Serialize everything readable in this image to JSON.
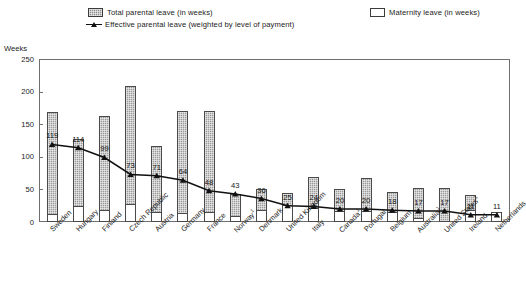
{
  "legend": {
    "items": [
      {
        "id": "total-parental-leave",
        "label": "Total parental leave (in weeks)",
        "marker": "filled-square-icon",
        "color": "#9a9a9a"
      },
      {
        "id": "effective-parental-leave",
        "label": "Effective parental leave (weighted by level of payment)",
        "marker": "line-triangle-icon",
        "color": "#111111"
      },
      {
        "id": "maternity-leave",
        "label": "Maternity leave (in weeks)",
        "marker": "empty-square-icon",
        "color": "#ffffff"
      }
    ]
  },
  "chart_data": {
    "type": "bar",
    "title": "",
    "subtitle": "",
    "xlabel": "",
    "ylabel": "Weeks",
    "ylim": [
      0,
      250
    ],
    "yticks": [
      0,
      50,
      100,
      150,
      200,
      250
    ],
    "grid": false,
    "legend_position": "top",
    "categories": [
      "Sweden",
      "Hungary",
      "Finland",
      "Czech Republic",
      "Austria",
      "Germany",
      "France",
      "Norway",
      "Denmark",
      "United Kingdom",
      "Italy",
      "Canada",
      "Portugal",
      "Belgium",
      "Australia",
      "United States",
      "Ireland",
      "Netherlands"
    ],
    "category_footnotes": {
      "Norway": "1",
      "Canada": "1",
      "Australia": "1",
      "United States": "1"
    },
    "series": [
      {
        "name": "Total parental leave (in weeks)",
        "type": "bar",
        "values": [
          169,
          128,
          162,
          208,
          117,
          170,
          170,
          43,
          50,
          44,
          69,
          50,
          68,
          46,
          52,
          52,
          42,
          16
        ]
      },
      {
        "name": "Maternity leave (in weeks)",
        "type": "bar-segment",
        "values": [
          12,
          24,
          18,
          28,
          16,
          14,
          16,
          9,
          18,
          26,
          22,
          17,
          17,
          15,
          6,
          0,
          18,
          16
        ]
      },
      {
        "name": "Effective parental leave (weighted by level of payment)",
        "type": "line",
        "values": [
          119,
          114,
          99,
          73,
          71,
          64,
          48,
          43,
          36,
          25,
          24,
          20,
          20,
          18,
          17,
          17,
          11,
          11
        ]
      }
    ],
    "data_labels": [
      119,
      114,
      99,
      73,
      71,
      64,
      48,
      43,
      36,
      25,
      24,
      20,
      20,
      18,
      17,
      17,
      11,
      11
    ]
  }
}
